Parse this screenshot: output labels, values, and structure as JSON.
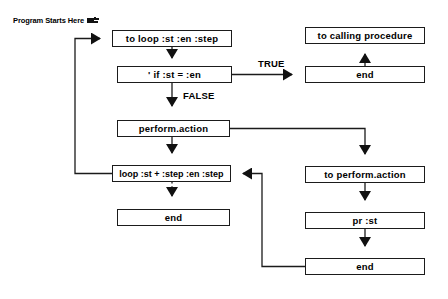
{
  "diagram": {
    "title_note": {
      "text": "Program Starts Here",
      "icon": "pointing-hand-icon"
    },
    "nodes": [
      {
        "id": "to-loop",
        "label": "to loop :st :en :step",
        "x": 112,
        "y": 30,
        "w": 120,
        "h": 17
      },
      {
        "id": "if-test",
        "label": "' if :st = :en",
        "x": 117,
        "y": 66,
        "w": 115,
        "h": 17
      },
      {
        "id": "perform-action",
        "label": "perform.action",
        "x": 117,
        "y": 120,
        "w": 113,
        "h": 17
      },
      {
        "id": "loop-recurse",
        "label": "loop :st + :step :en :step",
        "x": 112,
        "y": 165,
        "w": 119,
        "h": 17
      },
      {
        "id": "loop-end",
        "label": "end",
        "x": 117,
        "y": 209,
        "w": 113,
        "h": 17
      },
      {
        "id": "to-calling-proc",
        "label": "to calling procedure",
        "x": 305,
        "y": 27,
        "w": 120,
        "h": 17
      },
      {
        "id": "true-end",
        "label": "end",
        "x": 305,
        "y": 66,
        "w": 120,
        "h": 17
      },
      {
        "id": "to-perform-action",
        "label": "to perform.action",
        "x": 305,
        "y": 166,
        "w": 120,
        "h": 17
      },
      {
        "id": "pr-st",
        "label": "pr :st",
        "x": 305,
        "y": 212,
        "w": 120,
        "h": 17
      },
      {
        "id": "perform-end",
        "label": "end",
        "x": 305,
        "y": 258,
        "w": 120,
        "h": 17
      }
    ],
    "edge_labels": [
      {
        "id": "true-label",
        "text": "TRUE",
        "x": 258,
        "y": 58
      },
      {
        "id": "false-label",
        "text": "FALSE",
        "x": 183,
        "y": 97
      }
    ],
    "colors": {
      "stroke": "#1b1b1b",
      "background": "#ffffff",
      "text": "#000000"
    }
  }
}
